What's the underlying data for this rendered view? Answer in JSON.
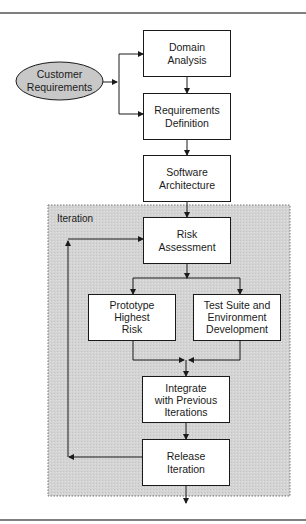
{
  "diagram": {
    "colors": {
      "line": "#1a1a1a",
      "box_fill": "#ffffff",
      "ellipse_fill": "#c8c8c8",
      "region_fill": "#d6d6d6",
      "rule": "#555555"
    },
    "region": {
      "label": "Iteration"
    },
    "nodes": {
      "customer_requirements": {
        "shape": "ellipse",
        "lines": [
          "Customer",
          "Requirements"
        ]
      },
      "domain_analysis": {
        "shape": "box",
        "lines": [
          "Domain",
          "Analysis"
        ]
      },
      "requirements_definition": {
        "shape": "box",
        "lines": [
          "Requirements",
          "Definition"
        ]
      },
      "software_architecture": {
        "shape": "box",
        "lines": [
          "Software",
          "Architecture"
        ]
      },
      "risk_assessment": {
        "shape": "box",
        "lines": [
          "Risk",
          "Assessment"
        ]
      },
      "prototype_highest_risk": {
        "shape": "box",
        "lines": [
          "Prototype",
          "Highest",
          "Risk"
        ]
      },
      "test_suite": {
        "shape": "box",
        "lines": [
          "Test Suite and",
          "Environment",
          "Development"
        ]
      },
      "integrate": {
        "shape": "box",
        "lines": [
          "Integrate",
          "with Previous",
          "Iterations"
        ]
      },
      "release_iteration": {
        "shape": "box",
        "lines": [
          "Release",
          "Iteration"
        ]
      }
    },
    "edges": [
      {
        "from": "customer_requirements",
        "to": "domain_analysis"
      },
      {
        "from": "customer_requirements",
        "to": "requirements_definition"
      },
      {
        "from": "domain_analysis",
        "to": "requirements_definition"
      },
      {
        "from": "requirements_definition",
        "to": "software_architecture"
      },
      {
        "from": "software_architecture",
        "to": "risk_assessment"
      },
      {
        "from": "risk_assessment",
        "to": "prototype_highest_risk"
      },
      {
        "from": "risk_assessment",
        "to": "test_suite"
      },
      {
        "from": "prototype_highest_risk",
        "to": "integrate"
      },
      {
        "from": "test_suite",
        "to": "integrate"
      },
      {
        "from": "integrate",
        "to": "release_iteration"
      },
      {
        "from": "release_iteration",
        "to": "risk_assessment",
        "type": "loop"
      },
      {
        "from": "release_iteration",
        "to": "exit"
      }
    ]
  }
}
